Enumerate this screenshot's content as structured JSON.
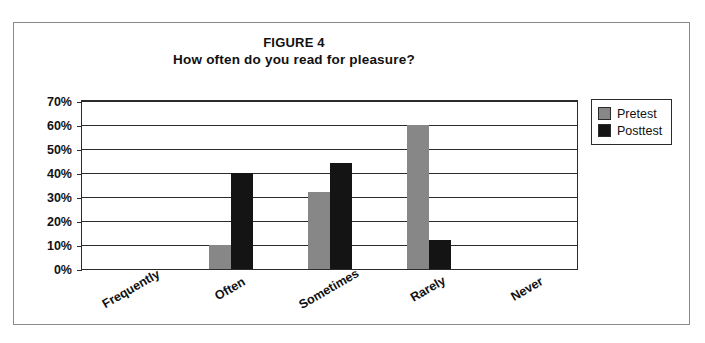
{
  "figure": {
    "label": "FIGURE 4",
    "subtitle": "How often do you read for pleasure?"
  },
  "legend": {
    "items": [
      {
        "name": "Pretest",
        "color": "#878787"
      },
      {
        "name": "Posttest",
        "color": "#141414"
      }
    ]
  },
  "axis": {
    "y_ticks": [
      "70%",
      "60%",
      "50%",
      "40%",
      "30%",
      "20%",
      "10%",
      "0%"
    ]
  },
  "chart_data": {
    "type": "bar",
    "title": "FIGURE 4",
    "subtitle": "How often do you read for pleasure?",
    "xlabel": "",
    "ylabel": "",
    "ylim": [
      0,
      70
    ],
    "ytick_values": [
      0,
      10,
      20,
      30,
      40,
      50,
      60,
      70
    ],
    "ytick_labels": [
      "0%",
      "10%",
      "20%",
      "30%",
      "40%",
      "50%",
      "60%",
      "70%"
    ],
    "grid": true,
    "grid_axis": "y",
    "legend_position": "outside right top",
    "units": "percent",
    "categories": [
      "Frequently",
      "Often",
      "Sometimes",
      "Rarely",
      "Never"
    ],
    "series": [
      {
        "name": "Pretest",
        "color": "#878787",
        "values": [
          0,
          10,
          32,
          60,
          0
        ]
      },
      {
        "name": "Posttest",
        "color": "#141414",
        "values": [
          0,
          40,
          44,
          12,
          0
        ]
      }
    ]
  }
}
